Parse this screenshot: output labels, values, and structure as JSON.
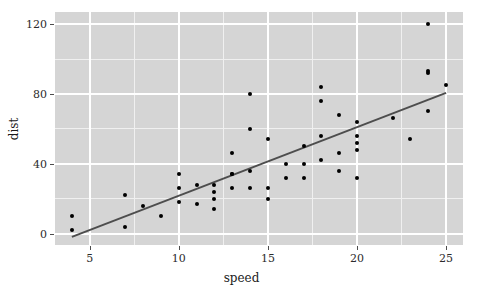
{
  "chart_data": {
    "type": "scatter",
    "title": "",
    "subtitle": "",
    "xlabel": "speed",
    "ylabel": "dist",
    "xticks": [
      5,
      10,
      15,
      20,
      25
    ],
    "yticks": [
      0,
      40,
      80,
      120
    ],
    "xticklabels": [
      "5",
      "10",
      "15",
      "20",
      "25"
    ],
    "yticklabels": [
      "0",
      "40",
      "80",
      "120"
    ],
    "x_minor_ticks": [
      7.5,
      12.5,
      17.5,
      22.5
    ],
    "y_minor_ticks": [
      20,
      60,
      100
    ],
    "xlim": [
      3.05,
      25.95
    ],
    "ylim": [
      -6.5,
      127.0
    ],
    "grid": true,
    "legend": null,
    "x": [
      4,
      4,
      7,
      7,
      8,
      9,
      10,
      10,
      10,
      11,
      11,
      12,
      12,
      12,
      12,
      13,
      13,
      13,
      13,
      14,
      14,
      14,
      14,
      15,
      15,
      15,
      16,
      16,
      17,
      17,
      17,
      18,
      18,
      18,
      18,
      19,
      19,
      19,
      20,
      20,
      20,
      20,
      20,
      22,
      23,
      24,
      24,
      24,
      24,
      25
    ],
    "y": [
      2,
      10,
      4,
      22,
      16,
      10,
      18,
      26,
      34,
      17,
      28,
      14,
      20,
      24,
      28,
      26,
      34,
      34,
      46,
      26,
      36,
      60,
      80,
      20,
      26,
      54,
      32,
      40,
      32,
      40,
      50,
      42,
      56,
      76,
      84,
      36,
      46,
      68,
      32,
      48,
      52,
      56,
      64,
      66,
      54,
      70,
      92,
      93,
      120,
      85
    ],
    "n_points": 50,
    "point_color": "#000000",
    "point_size": 4,
    "fit_line": {
      "type": "linear",
      "intercept": -17.58,
      "slope": 3.93,
      "color": "#4d4d4d",
      "width": 2,
      "x_start": 4,
      "x_end": 25,
      "y_start": -1.86,
      "y_end": 80.67
    },
    "panel_background": "#d5d5d5",
    "figure_background": "#ffffff",
    "major_gridline_color": "#ffffff",
    "minor_gridline_color": "#f0f0f0"
  }
}
